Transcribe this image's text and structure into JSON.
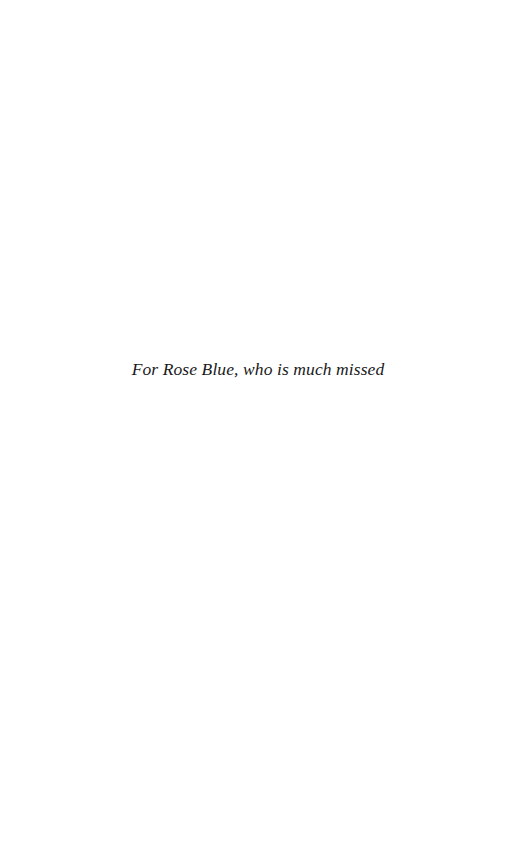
{
  "page": {
    "type": "dedication",
    "background_color": "#ffffff"
  },
  "dedication": {
    "text": "For Rose Blue, who is much missed",
    "color": "#1a1a1a"
  }
}
